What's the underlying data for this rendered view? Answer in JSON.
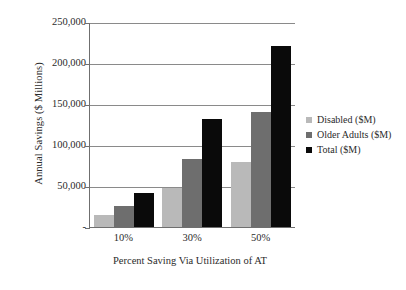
{
  "chart_data": {
    "type": "bar",
    "title": "",
    "xlabel": "Percent Saving Via Utilization of AT",
    "ylabel": "Annual Savings ($ Millions)",
    "categories": [
      "10%",
      "30%",
      "50%"
    ],
    "series": [
      {
        "name": "Disabled ($M)",
        "values": [
          16000,
          49000,
          81000
        ],
        "color": "#b9b9b9"
      },
      {
        "name": "Older Adults ($M)",
        "values": [
          27000,
          84000,
          141000
        ],
        "color": "#6e6e6e"
      },
      {
        "name": "Total ($M)",
        "values": [
          43000,
          133000,
          222000
        ],
        "color": "#0a0a0a"
      }
    ],
    "ylim": [
      0,
      250000
    ],
    "ytick_labels": [
      "250,000",
      "200,000",
      "150,000",
      "100,000",
      "50,000",
      "-"
    ],
    "ytick_values": [
      250000,
      200000,
      150000,
      100000,
      50000,
      0
    ],
    "grid": true,
    "legend_position": "right"
  },
  "axis": {
    "y_title": "Annual Savings ($ Millions)",
    "x_title": "Percent Saving Via Utilization of AT"
  },
  "legend": {
    "items": [
      {
        "label": "Disabled ($M)",
        "color": "#b9b9b9"
      },
      {
        "label": "Older Adults ($M)",
        "color": "#6e6e6e"
      },
      {
        "label": "Total ($M)",
        "color": "#0a0a0a"
      }
    ]
  },
  "colors": {
    "axis": "#6f6f6f",
    "gridline": "#8a8a8a",
    "text": "#2b2b2b",
    "background": "#ffffff"
  }
}
